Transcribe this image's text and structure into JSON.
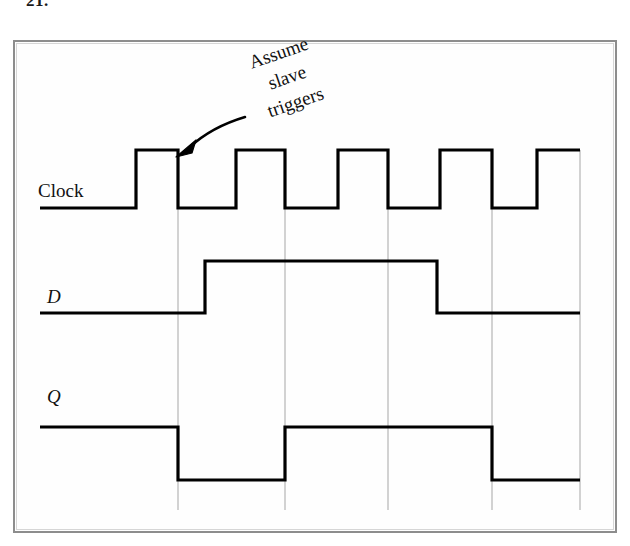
{
  "figure": {
    "problem_number": "21.",
    "annotation": {
      "lines": [
        "Assume",
        "slave",
        "triggers"
      ],
      "arrow": "curved-arrow-to-clock-falling-edge"
    },
    "colors": {
      "waveform": "#000000",
      "gridline": "#b4b4b4",
      "frame": "#8d8d8d",
      "background": "#ffffff"
    },
    "signals": [
      {
        "name": "Clock",
        "label": "Clock",
        "style": "upright",
        "baseline_y": 208,
        "high_y": 150,
        "start_x": 40,
        "end_x": 580,
        "initial_level": 0,
        "transitions": [
          {
            "x": 136,
            "level": 1
          },
          {
            "x": 178,
            "level": 0
          },
          {
            "x": 236,
            "level": 1
          },
          {
            "x": 285,
            "level": 0
          },
          {
            "x": 338,
            "level": 1
          },
          {
            "x": 388,
            "level": 0
          },
          {
            "x": 440,
            "level": 1
          },
          {
            "x": 492,
            "level": 0
          },
          {
            "x": 537,
            "level": 1
          }
        ]
      },
      {
        "name": "D",
        "label": "D",
        "style": "italic",
        "baseline_y": 313,
        "high_y": 261,
        "start_x": 40,
        "end_x": 580,
        "initial_level": 0,
        "transitions": [
          {
            "x": 205,
            "level": 1
          },
          {
            "x": 437,
            "level": 0
          }
        ]
      },
      {
        "name": "Q",
        "label": "Q",
        "style": "italic",
        "baseline_y": 427,
        "low_y": 480,
        "start_x": 40,
        "end_x": 580,
        "initial_level": 1,
        "transitions": [
          {
            "x": 178,
            "level": 0
          },
          {
            "x": 285,
            "level": 1
          },
          {
            "x": 492,
            "level": 0
          }
        ]
      }
    ],
    "gridlines": [
      {
        "x": 178,
        "y1": 208,
        "y2": 510
      },
      {
        "x": 285,
        "y1": 208,
        "y2": 510
      },
      {
        "x": 388,
        "y1": 208,
        "y2": 510
      },
      {
        "x": 492,
        "y1": 208,
        "y2": 510
      },
      {
        "x": 580,
        "y1": 150,
        "y2": 510
      }
    ]
  }
}
